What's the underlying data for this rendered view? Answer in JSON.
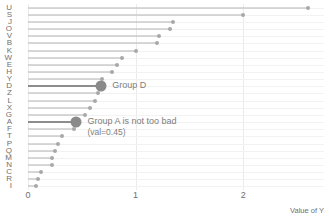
{
  "chart_data": {
    "type": "bar",
    "subtype": "lollipop-horizontal",
    "title": "",
    "subtitle": "",
    "xlabel": "Value of Y",
    "ylabel": "",
    "xlim": [
      0,
      2.75
    ],
    "ylim": [
      0,
      26
    ],
    "grid": true,
    "legend": false,
    "orientation": "horizontal",
    "xticks": [
      {
        "value": 0,
        "label": "0"
      },
      {
        "value": 1,
        "label": "1"
      },
      {
        "value": 2,
        "label": "2"
      }
    ],
    "categories": [
      "U",
      "S",
      "J",
      "O",
      "V",
      "B",
      "K",
      "W",
      "E",
      "H",
      "Y",
      "D",
      "Z",
      "L",
      "X",
      "G",
      "A",
      "F",
      "T",
      "P",
      "Q",
      "M",
      "N",
      "C",
      "R",
      "I"
    ],
    "values": [
      2.6,
      2.0,
      1.35,
      1.32,
      1.22,
      1.2,
      1.0,
      0.87,
      0.83,
      0.78,
      0.69,
      0.68,
      0.65,
      0.62,
      0.58,
      0.53,
      0.45,
      0.43,
      0.32,
      0.28,
      0.25,
      0.22,
      0.22,
      0.12,
      0.09,
      0.07
    ],
    "highlighted": [
      "D",
      "A"
    ],
    "annotations": [
      {
        "category": "D",
        "value": 0.68,
        "text": "Group D",
        "sub": ""
      },
      {
        "category": "A",
        "value": 0.45,
        "text": "Group A is not too bad",
        "sub": "(val=0.45)"
      }
    ],
    "colors": {
      "stem": "#b3b3b3",
      "dot": "#a8a8a8",
      "stem_highlight": "#8d8d8d",
      "dot_highlight": "#8a8a8a",
      "gridline": "#ebebeb",
      "text": "#6f6f6f",
      "annotation_text": "#7d7d7d",
      "background": "#ffffff"
    }
  }
}
